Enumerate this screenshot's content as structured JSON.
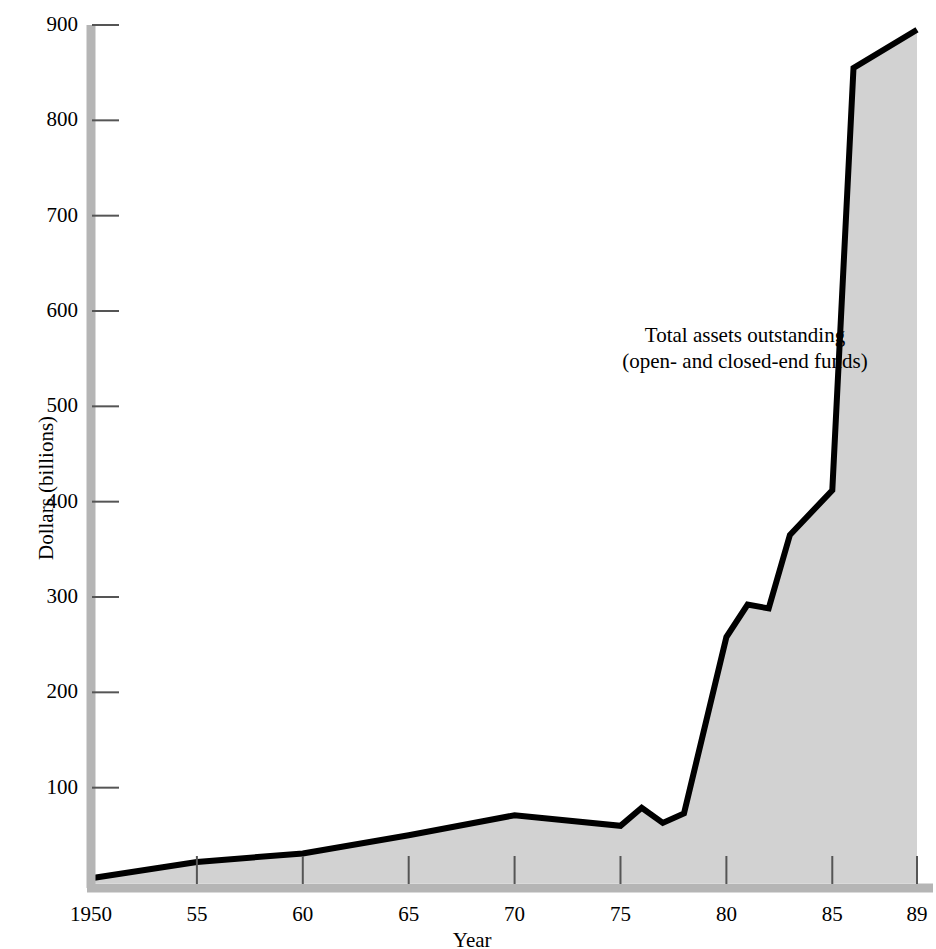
{
  "chart_data": {
    "type": "area",
    "title": "",
    "xlabel": "Year",
    "ylabel": "Dollars (billions)",
    "xlim": [
      1950,
      1989
    ],
    "ylim": [
      0,
      900
    ],
    "grid": false,
    "legend_position": "inline-annotation",
    "annotation_line1": "Total assets outstanding",
    "annotation_line2": "(open- and closed-end funds)",
    "x_tick_labels": [
      "1950",
      "55",
      "60",
      "65",
      "70",
      "75",
      "80",
      "85",
      "89"
    ],
    "x_tick_values": [
      1950,
      1955,
      1960,
      1965,
      1970,
      1975,
      1980,
      1985,
      1989
    ],
    "y_tick_labels": [
      "100",
      "200",
      "300",
      "400",
      "500",
      "600",
      "700",
      "800",
      "900"
    ],
    "y_tick_values": [
      100,
      200,
      300,
      400,
      500,
      600,
      700,
      800,
      900
    ],
    "series": [
      {
        "name": "Total assets outstanding (open- and closed-end funds)",
        "x": [
          1950,
          1955,
          1960,
          1965,
          1970,
          1975,
          1976,
          1977,
          1978,
          1980,
          1981,
          1982,
          1983,
          1985,
          1986,
          1989
        ],
        "values": [
          5,
          22,
          31,
          50,
          71,
          60,
          79,
          63,
          73,
          258,
          292,
          288,
          365,
          412,
          855,
          895
        ]
      }
    ]
  },
  "style": {
    "area_fill": "#d2d2d2",
    "line_color": "#000000",
    "axis_color": "#b0b0b0",
    "tick_color": "#555555",
    "text_color": "#000000"
  },
  "axis_titles": {
    "y": "Dollars (billions)",
    "x": "Year"
  }
}
